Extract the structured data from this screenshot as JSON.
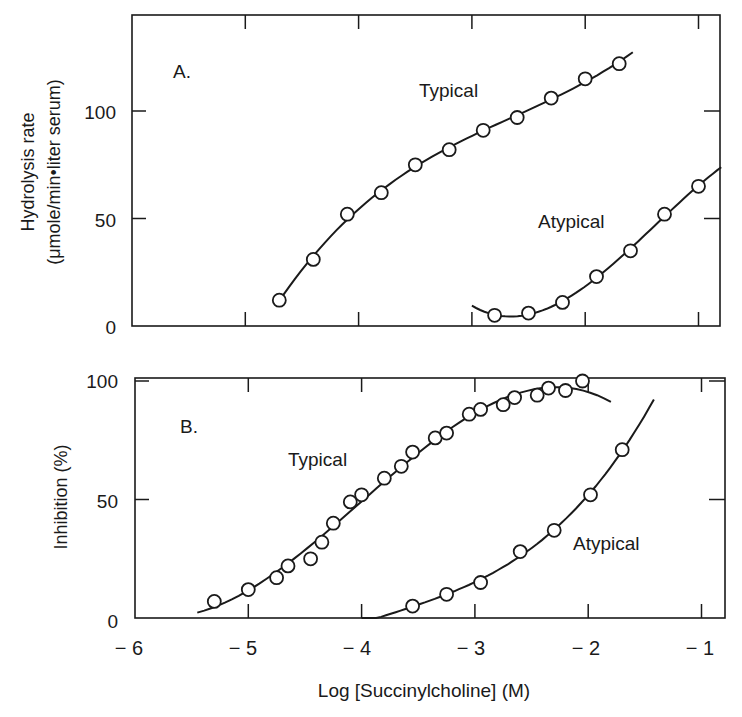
{
  "chart_data": [
    {
      "panel": "A",
      "type": "scatter",
      "panel_label": "A.",
      "title": "",
      "xlabel": "Log [Succinylcholine] (M)",
      "ylabel": "Hydrolysis rate",
      "ylabel_units": "(μmole/min•liter serum)",
      "xlim": [
        -6,
        -0.8
      ],
      "ylim": [
        0,
        130
      ],
      "x_ticks": [
        -6,
        -5,
        -4,
        -3,
        -2,
        -1
      ],
      "y_ticks": [
        0,
        50,
        100
      ],
      "y_tick_labels": [
        "0",
        "50",
        "100"
      ],
      "grid": false,
      "legend": "none (inline labels)",
      "series": [
        {
          "name": "Typical",
          "marker": "open-circle",
          "line": "smooth fitted curve",
          "x": [
            -4.7,
            -4.4,
            -4.1,
            -3.8,
            -3.5,
            -3.2,
            -2.9,
            -2.6,
            -2.3,
            -2.0,
            -1.7
          ],
          "y": [
            12,
            31,
            52,
            62,
            75,
            82,
            91,
            97,
            106,
            115,
            122
          ],
          "curve": {
            "x_start": -4.72,
            "x_end": -1.58
          }
        },
        {
          "name": "Atypical",
          "marker": "open-circle",
          "line": "smooth fitted curve",
          "x": [
            -2.8,
            -2.5,
            -2.2,
            -1.9,
            -1.6,
            -1.3,
            -1.0
          ],
          "y": [
            5,
            6,
            11,
            23,
            35,
            52,
            65
          ],
          "curve": {
            "x_start": -3.0,
            "x_end": -0.8
          }
        }
      ]
    },
    {
      "panel": "B",
      "type": "scatter",
      "panel_label": "B.",
      "title": "",
      "xlabel": "Log [Succinylcholine] (M)",
      "ylabel": "Inhibition (%)",
      "xlim": [
        -6,
        -0.8
      ],
      "ylim": [
        0,
        100
      ],
      "x_ticks": [
        -6,
        -5,
        -4,
        -3,
        -2,
        -1
      ],
      "x_tick_labels": [
        "− 6",
        "− 5",
        "− 4",
        "− 3",
        "− 2",
        "− 1"
      ],
      "y_ticks": [
        0,
        50,
        100
      ],
      "y_tick_labels": [
        "0",
        "50",
        "100"
      ],
      "grid": false,
      "legend": "none (inline labels)",
      "series": [
        {
          "name": "Typical",
          "marker": "open-circle",
          "line": "smooth sigmoid fit",
          "x": [
            -5.3,
            -5.0,
            -4.75,
            -4.65,
            -4.45,
            -4.35,
            -4.25,
            -4.1,
            -4.0,
            -3.8,
            -3.65,
            -3.55,
            -3.35,
            -3.25,
            -3.05,
            -2.95,
            -2.75,
            -2.65,
            -2.45,
            -2.35,
            -2.2,
            -2.05
          ],
          "y": [
            7,
            12,
            17,
            22,
            25,
            32,
            40,
            49,
            52,
            59,
            64,
            70,
            76,
            78,
            86,
            88,
            90,
            93,
            94,
            97,
            96,
            100
          ],
          "curve": {
            "x_start": -5.45,
            "x_end": -1.8
          }
        },
        {
          "name": "Atypical",
          "marker": "open-circle",
          "line": "smooth sigmoid fit",
          "x": [
            -3.55,
            -3.25,
            -2.95,
            -2.6,
            -2.3,
            -1.98,
            -1.7
          ],
          "y": [
            5,
            10,
            15,
            28,
            37,
            52,
            71
          ],
          "curve": {
            "x_start": -4.0,
            "x_end": -1.42
          }
        }
      ]
    }
  ],
  "labels": {
    "panel_a": "A.",
    "panel_b": "B.",
    "typical": "Typical",
    "atypical": "Atypical",
    "a_ylabel_line1": "Hydrolysis rate",
    "a_ylabel_line2": "(μmole/min•liter serum)",
    "b_ylabel": "Inhibition (%)",
    "xlabel": "Log [Succinylcholine] (M)",
    "y0": "0",
    "y50": "50",
    "y100": "100",
    "xticks": [
      "− 6",
      "− 5",
      "− 4",
      "− 3",
      "− 2",
      "− 1"
    ]
  },
  "colors": {
    "ink": "#1a1a1a",
    "background": "#ffffff"
  }
}
